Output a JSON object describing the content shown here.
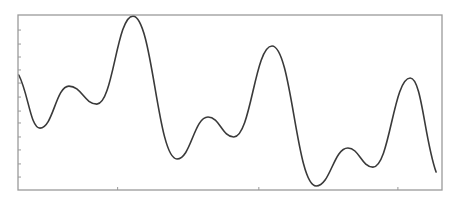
{
  "chart_data": {
    "type": "line",
    "title": "",
    "xlabel": "",
    "ylabel": "",
    "grid": false,
    "legend": null,
    "xlim": [
      0,
      1
    ],
    "ylim": [
      0,
      1
    ],
    "x_ticks": [
      0.235,
      0.568,
      0.896
    ],
    "x_tick_labels": [],
    "y_ticks": [
      0.914,
      0.834,
      0.76,
      0.686,
      0.611,
      0.531,
      0.451,
      0.383,
      0.303,
      0.229,
      0.149,
      0.074
    ],
    "y_tick_labels": [],
    "series": [
      {
        "name": "signal",
        "color": "#3a3a3a",
        "x": [
          0.002,
          0.052,
          0.12,
          0.186,
          0.271,
          0.375,
          0.448,
          0.509,
          0.599,
          0.703,
          0.778,
          0.837,
          0.925,
          0.986
        ],
        "y": [
          0.657,
          0.354,
          0.594,
          0.491,
          0.994,
          0.177,
          0.417,
          0.303,
          0.823,
          0.023,
          0.24,
          0.131,
          0.64,
          0.103
        ]
      }
    ],
    "frame": {
      "left": 18,
      "top": 15,
      "right": 442,
      "bottom": 190
    },
    "colors": {
      "line": "#3a3a3a",
      "axes": "#9a9a9a",
      "background": "#ffffff"
    }
  }
}
